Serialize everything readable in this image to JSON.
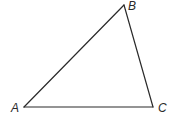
{
  "diagram": {
    "type": "triangle",
    "vertices": [
      {
        "id": "A",
        "label": "A",
        "x": 24,
        "y": 107
      },
      {
        "id": "B",
        "label": "B",
        "x": 124,
        "y": 5
      },
      {
        "id": "C",
        "label": "C",
        "x": 153,
        "y": 107
      }
    ],
    "edges": [
      {
        "from": "A",
        "to": "B"
      },
      {
        "from": "B",
        "to": "C"
      },
      {
        "from": "C",
        "to": "A"
      }
    ],
    "colors": {
      "stroke": "#2a2a2a",
      "background": "#ffffff"
    }
  }
}
